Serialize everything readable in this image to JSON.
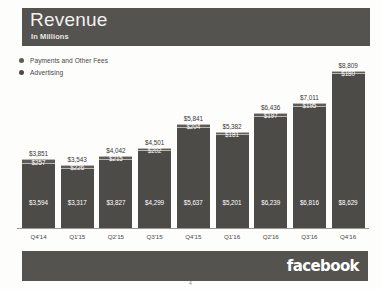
{
  "slide": {
    "title": "Revenue",
    "subtitle": "In Millions",
    "page_number": "4"
  },
  "legend": {
    "items": [
      {
        "label": "Payments and Other Fees",
        "color": "#5d5b57"
      },
      {
        "label": "Advertising",
        "color": "#4d4b48"
      }
    ]
  },
  "footer": {
    "wordmark": "facebook"
  },
  "chart_data": {
    "type": "bar",
    "stacked": true,
    "title": "Revenue",
    "subtitle": "In Millions",
    "xlabel": "",
    "ylabel": "",
    "ylim": [
      0,
      8809
    ],
    "grid": false,
    "legend_position": "top-left",
    "categories": [
      "Q4'14",
      "Q1'15",
      "Q2'15",
      "Q3'15",
      "Q4'15",
      "Q1'16",
      "Q2'16",
      "Q3'16",
      "Q4'16"
    ],
    "series": [
      {
        "name": "Advertising",
        "color": "#4d4b48",
        "values": [
          3594,
          3317,
          3827,
          4299,
          5637,
          5201,
          6239,
          6816,
          8629
        ],
        "labels": [
          "$3,594",
          "$3,317",
          "$3,827",
          "$4,299",
          "$5,637",
          "$5,201",
          "$6,239",
          "$6,816",
          "$8,629"
        ]
      },
      {
        "name": "Payments and Other Fees",
        "color": "#5d5b57",
        "values": [
          257,
          226,
          215,
          202,
          204,
          181,
          197,
          195,
          180
        ],
        "labels": [
          "$257",
          "$226",
          "$215",
          "$202",
          "$204",
          "$181",
          "$197",
          "$195",
          "$180"
        ]
      }
    ],
    "totals": [
      3851,
      3543,
      4042,
      4501,
      5841,
      5382,
      6436,
      7011,
      8809
    ],
    "total_labels": [
      "$3,851",
      "$3,543",
      "$4,042",
      "$4,501",
      "$5,841",
      "$5,382",
      "$6,436",
      "$7,011",
      "$8,809"
    ]
  }
}
